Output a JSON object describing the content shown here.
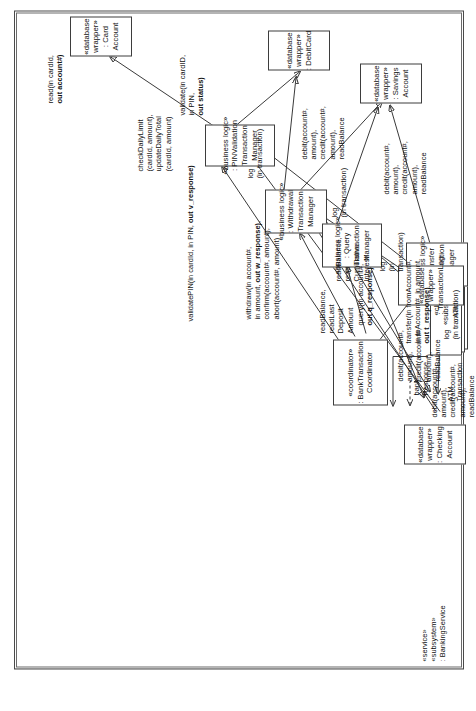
{
  "diagram": {
    "type": "uml-communication-diagram",
    "orientation": "rotated-90-ccw",
    "accent_color": "#3a3a3a",
    "background_color": "#ffffff"
  },
  "frames": {
    "banking_service": {
      "stereotype": "«service»",
      "stereotype2": "«subsystem»",
      "name": ": BankingService"
    }
  },
  "nodes": {
    "atm_client": {
      "stereotype": "«client»",
      "stereotype2": "«subsystem»",
      "name": ": ATMClient"
    },
    "coordinator": {
      "stereotype": "«coordinator»",
      "name1": ": BankTransaction",
      "name2": "Coordinator"
    },
    "pin_validation": {
      "stereotype": "«business logic»",
      "name1": ": PINValidation",
      "name2": "Transaction",
      "name3": "Manager"
    },
    "withdrawal": {
      "stereotype": "«business logic»",
      "name1": ": Withdrawal",
      "name2": "Transaction",
      "name3": "Manager"
    },
    "query": {
      "stereotype": "«business logic»",
      "name1": ": Query",
      "name2": "Transaction",
      "name3": "Manager"
    },
    "transfer": {
      "stereotype": "«business logic»",
      "name1": ": Transfer",
      "name2": "Transaction",
      "name3": "Manager"
    },
    "card_account": {
      "stereotype": "«database",
      "stereotype2": "wrapper»",
      "name1": ": Card",
      "name2": "Account"
    },
    "debit_card": {
      "stereotype": "«database",
      "stereotype2": "wrapper»",
      "name1": ": DebitCard"
    },
    "savings_account": {
      "stereotype": "«database",
      "stereotype2": "wrapper»",
      "name1": ": Savings",
      "name2": "Account"
    },
    "transaction_log": {
      "stereotype": "«database",
      "stereotype2": "wrapper»",
      "name1": ": TransactionLog"
    },
    "checking_account": {
      "stereotype": "«database",
      "stereotype2": "wrapper»",
      "name1": ": Checking",
      "name2": "Account"
    }
  },
  "messages": {
    "atm_transaction": "ATM\nTransaction",
    "bank_response": "bank\nResponse",
    "validate_pin": "validatePIN(in cardId, in PIN, ",
    "validate_pin_bold": "out v_response)",
    "withdraw": "withdraw(in account#,\nin amount, ",
    "withdraw_bold": "out w_response)",
    "withdraw_rest": ",\nconfirm(account#, amount),\nabort(account#, amount)",
    "query": "query(in account#,\n",
    "query_bold": "out q_response)",
    "transfer": "transfer(in fromAccount#,\nin toAccount#, in amount,\n",
    "transfer_bold": "out t_response)",
    "read_card": "read(in cardId,\n",
    "read_card_bold": "out account#)",
    "validate_card": "validate(in cardID,\nin PIN,\n",
    "validate_card_bold": "out status)",
    "check_daily_limit": "checkDailyLimit\n(cardId, amount),\nupdateDailyTotal\n(cardId, amount)",
    "debit_credit_savings": "debit(account#,\namount),\ncredit(account#,\namount),\nreadBalance",
    "debit_credit_checking": "debit(account#,\namount),\ncredit(account#,\namount),\nreadBalance",
    "debit_credit_transfer": "debit(account#,\namount),\ncredit(account#,\namount),\nreadBalance",
    "debit_credit_query": "debit(account#,\namount),\ncredit(account#,\namount),\nreadBalance",
    "read_balance_deposit": "readBalance,\nreadLast\nDeposit\nAmount",
    "read_balance_cumulative": "readBalance,\nread\nCumulative\nInterest",
    "log_withdrawal": "log\n(in transaction)",
    "log_pin": "log\n(in transaction)",
    "log_query": "log\n(in\ntransaction)",
    "log_transfer": "log\n(in transaction)"
  }
}
